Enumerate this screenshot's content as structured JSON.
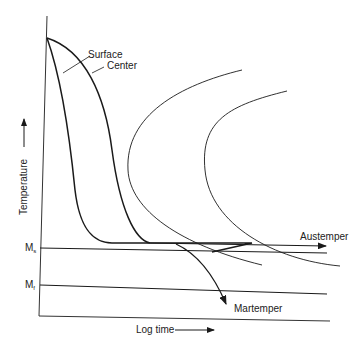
{
  "diagram": {
    "type": "TTT diagram with cooling curves",
    "y_axis_label": "Temperature",
    "x_axis_label": "Log time",
    "curve_labels": {
      "surface": "Surface",
      "center": "Center"
    },
    "levels": {
      "ms": {
        "main": "M",
        "sub": "s"
      },
      "mf": {
        "main": "M",
        "sub": "f"
      }
    },
    "processes": {
      "austemper": "Austemper",
      "martemper": "Martemper"
    },
    "colors": {
      "line": "#1a1a1a",
      "background": "#ffffff"
    }
  }
}
